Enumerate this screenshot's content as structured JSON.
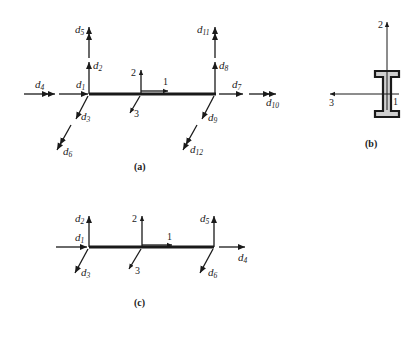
{
  "figure": {
    "panels": [
      {
        "id": "a",
        "caption": "(a)",
        "description": "Space-frame member element with 12 degrees of freedom and local axes 1, 2, 3",
        "left_node_labels": [
          "d1",
          "d2",
          "d3",
          "d4",
          "d5",
          "d6"
        ],
        "right_node_labels": [
          "d7",
          "d8",
          "d9",
          "d10",
          "d11",
          "d12"
        ],
        "local_axes": [
          "1",
          "2",
          "3"
        ]
      },
      {
        "id": "b",
        "caption": "(b)",
        "description": "I-section cross-section with local axes 2 (vertical), 3 (horizontal) and 1 (out of plane)",
        "axes": [
          "2",
          "3",
          "1"
        ]
      },
      {
        "id": "c",
        "caption": "(c)",
        "description": "Member element with 6 translational degrees of freedom and local axes 1, 2, 3",
        "left_node_labels": [
          "d1",
          "d2",
          "d3"
        ],
        "right_node_labels": [
          "d4",
          "d5",
          "d6"
        ],
        "local_axes": [
          "1",
          "2",
          "3"
        ]
      }
    ]
  },
  "labels": {
    "a": {
      "d1": "d",
      "d1s": "1",
      "d2": "d",
      "d2s": "2",
      "d3": "d",
      "d3s": "3",
      "d4": "d",
      "d4s": "4",
      "d5": "d",
      "d5s": "5",
      "d6": "d",
      "d6s": "6",
      "d7": "d",
      "d7s": "7",
      "d8": "d",
      "d8s": "8",
      "d9": "d",
      "d9s": "9",
      "d10": "d",
      "d10s": "10",
      "d11": "d",
      "d11s": "11",
      "d12": "d",
      "d12s": "12",
      "ax1": "1",
      "ax2": "2",
      "ax3": "3",
      "caption": "(a)"
    },
    "b": {
      "ax1": "1",
      "ax2": "2",
      "ax3": "3",
      "caption": "(b)"
    },
    "c": {
      "d1": "d",
      "d1s": "1",
      "d2": "d",
      "d2s": "2",
      "d3": "d",
      "d3s": "3",
      "d4": "d",
      "d4s": "4",
      "d5": "d",
      "d5s": "5",
      "d6": "d",
      "d6s": "6",
      "ax1": "1",
      "ax2": "2",
      "ax3": "3",
      "caption": "(c)"
    }
  },
  "colors": {
    "ink": "#1a1a1a",
    "section_fill": "#cfcfcf",
    "background": "#ffffff"
  }
}
